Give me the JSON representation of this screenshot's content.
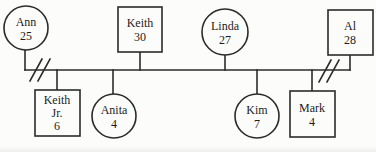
{
  "diagram": {
    "kind": "genogram-family-tree",
    "background_color": "#fcfcfa",
    "line_color": "#2b2b2b",
    "shape_fill": "#fcfcfa",
    "people": [
      {
        "id": "ann",
        "name": "Ann",
        "age": "25",
        "shape": "circle",
        "generation": "parent"
      },
      {
        "id": "keith",
        "name": "Keith",
        "age": "30",
        "shape": "square",
        "generation": "parent"
      },
      {
        "id": "linda",
        "name": "Linda",
        "age": "27",
        "shape": "circle",
        "generation": "parent"
      },
      {
        "id": "al",
        "name": "Al",
        "age": "28",
        "shape": "square",
        "generation": "parent"
      },
      {
        "id": "keith-jr",
        "name": "Keith Jr.",
        "name_lines": [
          "Keith",
          "Jr."
        ],
        "age": "6",
        "shape": "square",
        "generation": "child"
      },
      {
        "id": "anita",
        "name": "Anita",
        "age": "4",
        "shape": "circle",
        "generation": "child"
      },
      {
        "id": "kim",
        "name": "Kim",
        "age": "7",
        "shape": "circle",
        "generation": "child"
      },
      {
        "id": "mark",
        "name": "Mark",
        "age": "4",
        "shape": "square",
        "generation": "child"
      }
    ],
    "relationship_marks": [
      {
        "type": "separation-slashes",
        "near": "Ann"
      },
      {
        "type": "separation-slashes",
        "near": "Al"
      }
    ]
  }
}
